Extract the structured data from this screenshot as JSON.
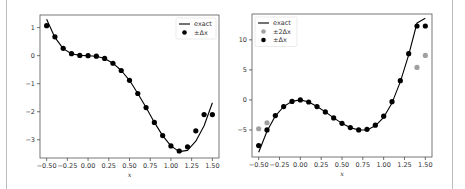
{
  "chart_data": [
    {
      "type": "line",
      "title": "",
      "xlabel": "x",
      "ylabel": "",
      "xlim": [
        -0.58,
        1.58
      ],
      "ylim": [
        -3.65,
        1.45
      ],
      "xticks": [
        -0.5,
        -0.25,
        0.0,
        0.25,
        0.5,
        0.75,
        1.0,
        1.25,
        1.5
      ],
      "xtick_labels": [
        "−0.50",
        "−0.25",
        "0.00",
        "0.25",
        "0.50",
        "0.75",
        "1.00",
        "1.25",
        "1.50"
      ],
      "yticks": [
        1,
        0,
        -1,
        -2,
        -3
      ],
      "ytick_labels": [
        "1",
        "0",
        "−1",
        "−2",
        "−3"
      ],
      "grid": false,
      "legend_position": "upper right",
      "legend": [
        "exact",
        "±Δx"
      ],
      "series": [
        {
          "name": "exact",
          "style": "line",
          "color": "#000000",
          "x": [
            -0.5,
            -0.4,
            -0.3,
            -0.2,
            -0.1,
            0.0,
            0.1,
            0.2,
            0.3,
            0.4,
            0.5,
            0.6,
            0.7,
            0.8,
            0.9,
            1.0,
            1.1,
            1.2,
            1.3,
            1.4,
            1.5
          ],
          "y": [
            1.3,
            0.65,
            0.25,
            0.07,
            0.01,
            0.0,
            -0.02,
            -0.1,
            -0.27,
            -0.53,
            -0.88,
            -1.35,
            -1.85,
            -2.38,
            -2.85,
            -3.22,
            -3.42,
            -3.38,
            -3.05,
            -2.5,
            -1.68
          ]
        },
        {
          "name": "±Δx",
          "style": "scatter",
          "color": "#000000",
          "x": [
            -0.5,
            -0.4,
            -0.3,
            -0.2,
            -0.1,
            0.0,
            0.1,
            0.2,
            0.3,
            0.4,
            0.5,
            0.6,
            0.7,
            0.8,
            0.9,
            1.0,
            1.1,
            1.2,
            1.3,
            1.4,
            1.5
          ],
          "y": [
            1.07,
            0.67,
            0.26,
            0.07,
            0.01,
            0.0,
            -0.02,
            -0.1,
            -0.27,
            -0.53,
            -0.88,
            -1.35,
            -1.85,
            -2.38,
            -2.85,
            -3.22,
            -3.4,
            -3.25,
            -2.68,
            -2.1,
            -2.1
          ]
        }
      ]
    },
    {
      "type": "line",
      "title": "",
      "xlabel": "x",
      "ylabel": "",
      "xlim": [
        -0.58,
        1.58
      ],
      "ylim": [
        -9.5,
        14.3
      ],
      "xticks": [
        -0.5,
        -0.25,
        0.0,
        0.25,
        0.5,
        0.75,
        1.0,
        1.25,
        1.5
      ],
      "xtick_labels": [
        "−0.50",
        "−0.25",
        "0.00",
        "0.25",
        "0.50",
        "0.75",
        "1.00",
        "1.25",
        "1.50"
      ],
      "yticks": [
        10,
        5,
        0,
        -5
      ],
      "ytick_labels": [
        "10",
        "5",
        "0",
        "−5"
      ],
      "grid": false,
      "legend_position": "upper left",
      "legend": [
        "exact",
        "±2Δx",
        "±Δx"
      ],
      "series": [
        {
          "name": "exact",
          "style": "line",
          "color": "#000000",
          "x": [
            -0.5,
            -0.4,
            -0.3,
            -0.2,
            -0.1,
            0.0,
            0.1,
            0.2,
            0.3,
            0.4,
            0.5,
            0.6,
            0.7,
            0.8,
            0.9,
            1.0,
            1.1,
            1.2,
            1.3,
            1.4,
            1.5
          ],
          "y": [
            -8.7,
            -5.2,
            -2.7,
            -1.1,
            -0.25,
            0.0,
            -0.35,
            -1.1,
            -2.0,
            -3.0,
            -3.9,
            -4.6,
            -5.0,
            -5.0,
            -4.3,
            -2.9,
            -0.5,
            3.0,
            7.5,
            12.8,
            13.6
          ]
        },
        {
          "name": "±2Δx",
          "style": "scatter",
          "color": "#a0a0a0",
          "x": [
            -0.5,
            -0.4,
            1.4,
            1.5
          ],
          "y": [
            -4.8,
            -3.8,
            5.4,
            7.4
          ]
        },
        {
          "name": "±Δx",
          "style": "scatter",
          "color": "#000000",
          "x": [
            -0.5,
            -0.4,
            -0.3,
            -0.2,
            -0.1,
            0.0,
            0.1,
            0.2,
            0.3,
            0.4,
            0.5,
            0.6,
            0.7,
            0.8,
            0.9,
            1.0,
            1.1,
            1.2,
            1.3,
            1.4,
            1.5
          ],
          "y": [
            -7.6,
            -5.0,
            -2.6,
            -1.1,
            -0.25,
            0.0,
            -0.35,
            -1.1,
            -2.0,
            -3.0,
            -3.9,
            -4.6,
            -5.0,
            -4.9,
            -4.2,
            -2.7,
            -0.3,
            3.2,
            7.7,
            12.3,
            12.3
          ]
        }
      ]
    }
  ],
  "panels": [
    {
      "xlabel": "x",
      "legend": [
        {
          "label": "exact",
          "kind": "line",
          "color": "#000000"
        },
        {
          "label": "±Δx",
          "kind": "dot",
          "color": "#000000"
        }
      ]
    },
    {
      "xlabel": "x",
      "legend": [
        {
          "label": "exact",
          "kind": "line",
          "color": "#000000"
        },
        {
          "label": "±2Δx",
          "kind": "dot",
          "color": "#a0a0a0"
        },
        {
          "label": "±Δx",
          "kind": "dot",
          "color": "#000000"
        }
      ]
    }
  ]
}
